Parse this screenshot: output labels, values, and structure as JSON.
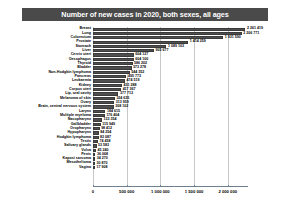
{
  "chart_data": {
    "type": "bar",
    "orientation": "horizontal",
    "title": "Number of new cases in 2020, both sexes, all ages",
    "xlabel": "",
    "ylabel": "",
    "xlim": [
      0,
      2300000
    ],
    "grid": true,
    "legend": null,
    "tick_labels": [
      "0",
      "500 000",
      "1 000 000",
      "1 500 000",
      "2 000 000"
    ],
    "tick_values": [
      0,
      500000,
      1000000,
      1500000,
      2000000
    ],
    "categories": [
      "Breast",
      "Lung",
      "Colorectum",
      "Prostate",
      "Stomach",
      "Liver",
      "Cervix uteri",
      "Oesophagus",
      "Thyroid",
      "Bladder",
      "Non-Hodgkin lymphoma",
      "Pancreas",
      "Leukaemia",
      "Kidney",
      "Corpus uteri",
      "Lip, oral cavity",
      "Melanoma of skin",
      "Ovary",
      "Brain, central nervous system",
      "Larynx",
      "Multiple myeloma",
      "Nasopharynx",
      "Gallbladder",
      "Oropharynx",
      "Hypopharynx",
      "Hodgkin lymphoma",
      "Testis",
      "Salivary glands",
      "Vulva",
      "Penis",
      "Kaposi sarcoma",
      "Mesothelioma",
      "Vagina"
    ],
    "values": [
      2261419,
      2206771,
      1931590,
      1414259,
      1089103,
      905677,
      604127,
      604100,
      586202,
      573278,
      544352,
      495773,
      474519,
      431288,
      417367,
      377713,
      324635,
      313959,
      308102,
      184615,
      176404,
      133354,
      115949,
      98412,
      84254,
      83087,
      74458,
      53583,
      45240,
      36068,
      34270,
      30870,
      17908
    ],
    "value_labels": [
      "2 261 419",
      "2 206 771",
      "1 931 590",
      "1 414 259",
      "1 089 103",
      "905 677",
      "604 127",
      "604 100",
      "586 202",
      "573 278",
      "544 352",
      "495 773",
      "474 519",
      "431 288",
      "417 367",
      "377 713",
      "324 635",
      "313 959",
      "308 102",
      "184 615",
      "176 404",
      "133 354",
      "115 949",
      "98 412",
      "84 254",
      "83 087",
      "74 458",
      "53 583",
      "45 240",
      "36 068",
      "34 270",
      "30 870",
      "17 908"
    ],
    "colors": {
      "bar": "#4f4f4f",
      "bar_border": "#3a3a3a",
      "title_banner": "#4a4a4a",
      "title_text": "#ffffff",
      "gridline": "#c8c8c8",
      "axis": "#6e7f92",
      "background": "#ffffff",
      "text": "#000000"
    }
  }
}
